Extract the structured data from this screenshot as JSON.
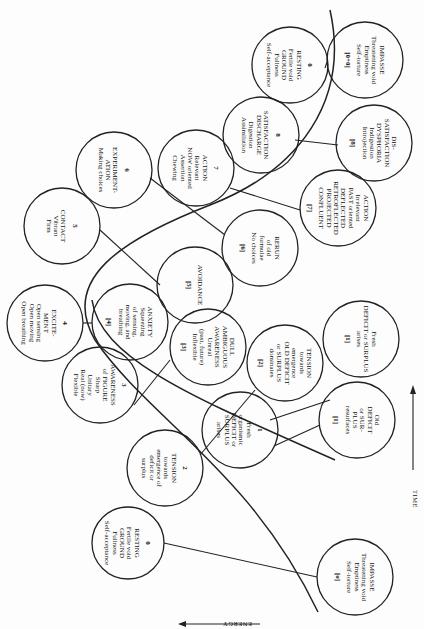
{
  "axes": {
    "energy": "ENERGY",
    "time": "TIME"
  },
  "healthy": [
    {
      "id": "h0a",
      "num": "0",
      "lines": [
        "RESTING",
        "Fertile void",
        "GROUND",
        "Fullness",
        "Self-acceptance"
      ],
      "cx": 128,
      "cy": 543,
      "r": 36
    },
    {
      "id": "h1",
      "num": "1",
      "lines": [
        "Fresh",
        "organismic",
        "DEFICIT or",
        "SURPLUS",
        "arises"
      ],
      "cx": 240,
      "cy": 430,
      "r": 38
    },
    {
      "id": "h2",
      "num": "2",
      "lines": [
        "TENSION",
        "towards",
        "emergence of",
        "deficit or",
        "surplus"
      ],
      "cx": 165,
      "cy": 468,
      "r": 38
    },
    {
      "id": "h3",
      "num": "3",
      "lines": [
        "AWARENESS",
        "of FIGURE",
        "Sharp",
        "Unitary",
        "Real (now)",
        "Flexible"
      ],
      "cx": 100,
      "cy": 385,
      "r": 38
    },
    {
      "id": "h4",
      "num": "4",
      "lines": [
        "EXCITE-",
        "MENT",
        "Open sensing",
        "Open moving",
        "Open breathing"
      ],
      "cx": 45,
      "cy": 323,
      "r": 38
    },
    {
      "id": "h5",
      "num": "5",
      "lines": [
        "CONTACT",
        "Vibrant",
        "Firm"
      ],
      "cx": 62,
      "cy": 226,
      "r": 38
    },
    {
      "id": "h6",
      "num": "6",
      "lines": [
        "EXPERIMENT-",
        "ATION",
        "Making choices"
      ],
      "cx": 114,
      "cy": 170,
      "r": 38
    },
    {
      "id": "h7",
      "num": "7",
      "lines": [
        "ACTION",
        "Relevant",
        "NOW oriented",
        "Assertion",
        "Chewing"
      ],
      "cx": 196,
      "cy": 168,
      "r": 38
    },
    {
      "id": "h8",
      "num": "8",
      "lines": [
        "SATISFACTION",
        "DISCHARGE",
        "Digestion",
        "Assimilation"
      ],
      "cx": 261,
      "cy": 135,
      "r": 38
    },
    {
      "id": "h0b",
      "num": "0",
      "lines": [
        "RESTING",
        "Fertile void",
        "GROUND",
        "Fullness",
        "Self-acceptance"
      ],
      "cx": 290,
      "cy": 65,
      "r": 38
    }
  ],
  "blocked": [
    {
      "id": "b0a",
      "tag": "[o]",
      "lines": [
        "IMPASSE",
        "Threatening void",
        "Emptiness",
        "Self-torture"
      ],
      "cx": 355,
      "cy": 577,
      "r": 38
    },
    {
      "id": "b1a",
      "tag": "[1]",
      "lines": [
        "Fresh",
        "DEFICIT or SURPLUS",
        "arises"
      ],
      "cx": 361,
      "cy": 339,
      "r": 38
    },
    {
      "id": "b1b",
      "tag": "[1]",
      "lines": [
        "Old",
        "DEFICIT",
        "or SUR-",
        "PLUS",
        "resurfaces"
      ],
      "cx": 357,
      "cy": 420,
      "r": 38
    },
    {
      "id": "b2",
      "tag": "[2]",
      "lines": [
        "TENSION",
        "towards",
        "emergence",
        "OLD DEFICIT",
        "or SURPLUS",
        "dominates"
      ],
      "cx": 285,
      "cy": 363,
      "r": 38
    },
    {
      "id": "b3",
      "tag": "[3]",
      "lines": [
        "DULL",
        "AMBIGUOUS",
        "AWARENESS",
        "Unreal",
        "(past, future)",
        "Inflexible"
      ],
      "cx": 208,
      "cy": 347,
      "r": 38
    },
    {
      "id": "b4",
      "tag": "[4]",
      "lines": [
        "ANXIETY",
        "Squeezing",
        "of sensing,",
        "moving, and",
        "breathing"
      ],
      "cx": 130,
      "cy": 322,
      "r": 38
    },
    {
      "id": "b5",
      "tag": "[5]",
      "lines": [
        "AVOIDANCE"
      ],
      "cx": 195,
      "cy": 285,
      "r": 38
    },
    {
      "id": "b6",
      "tag": "[6]",
      "lines": [
        "RERUN",
        "of old",
        "formulae",
        "No choices"
      ],
      "cx": 260,
      "cy": 248,
      "r": 38
    },
    {
      "id": "b7",
      "tag": "[7]",
      "lines": [
        "ACTION",
        "Irrelevant",
        "PAST oriented",
        "DEFLECTED",
        "RETROFLECTED",
        "PROJECTED",
        "CONFLUENT"
      ],
      "cx": 338,
      "cy": 208,
      "r": 38
    },
    {
      "id": "b8",
      "tag": "[8]",
      "lines": [
        "DIS-",
        "SATISFACTION",
        "DYSPHORIA",
        "Indigestion",
        "Introjection"
      ],
      "cx": 374,
      "cy": 143,
      "r": 38
    },
    {
      "id": "b0b",
      "tag": "[0+0]",
      "lines": [
        "IMPASSE",
        "Threatening void",
        "Emptiness",
        "Self-torture"
      ],
      "cx": 365,
      "cy": 60,
      "r": 38
    }
  ]
}
